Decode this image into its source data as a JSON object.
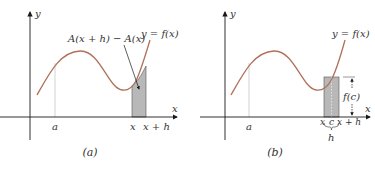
{
  "colors": {
    "axis": "#1a1a1a",
    "curve": "#b0705a",
    "shade": "#b8b8b8",
    "guide": "#c8c8c8",
    "text": "#333333"
  },
  "panels": [
    {
      "id": "a",
      "caption": "(a)",
      "axis_x_label": "x",
      "axis_y_label": "y",
      "curve_label": "y = f(x)",
      "area_label": "A(x + h) − A(x)",
      "tick_labels": [
        "a",
        "x",
        "x + h"
      ]
    },
    {
      "id": "b",
      "caption": "(b)",
      "axis_x_label": "x",
      "axis_y_label": "y",
      "curve_label": "y = f(x)",
      "height_label": "f(c)",
      "tick_labels": [
        "a",
        "x",
        "c",
        "x + h"
      ],
      "brace_label": "h"
    }
  ]
}
